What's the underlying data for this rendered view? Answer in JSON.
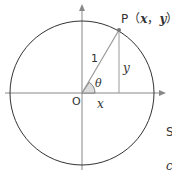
{
  "diagram": {
    "point_label_prefix": "P",
    "point_label_coords": "（x，y）",
    "point_label_x": "x",
    "point_label_y": "y",
    "radius_label": "1",
    "angle_label": "θ",
    "origin_label": "O",
    "x_segment_label": "x",
    "y_segment_label": "y",
    "cut_off_right_1": "S",
    "cut_off_right_2": "c",
    "colors": {
      "circle": "#333333",
      "axes": "#888888",
      "radius": "#999999",
      "angle_fill": "#dddddd",
      "point": "#777777",
      "text": "#333333"
    }
  }
}
